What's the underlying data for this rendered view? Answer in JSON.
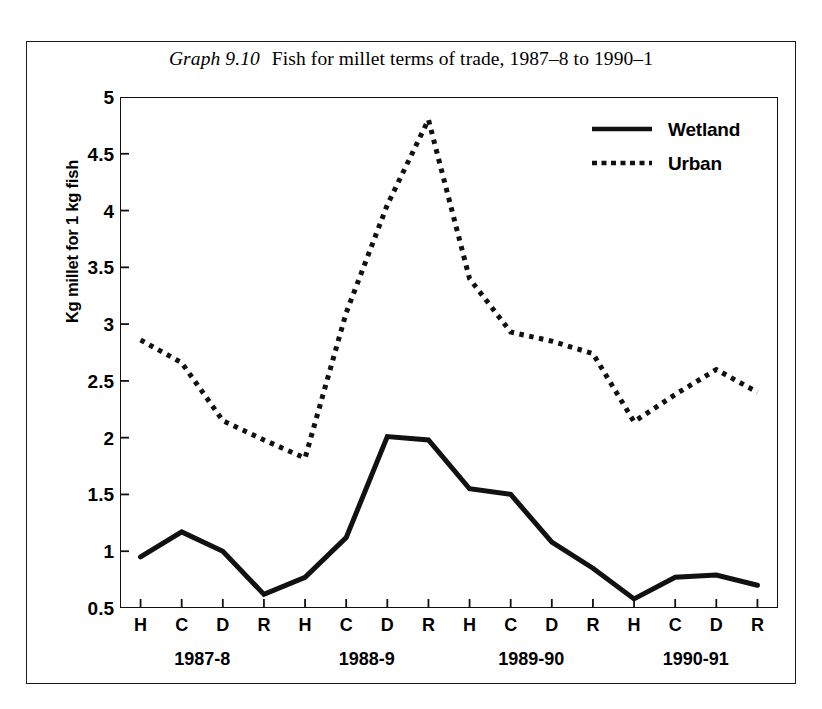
{
  "figure": {
    "title_number": "Graph 9.10",
    "title_text": "Fish for millet terms of trade, 1987–8 to 1990–1"
  },
  "chart_data": {
    "type": "line",
    "title": "Fish for millet terms of trade, 1987–8 to 1990–1",
    "xlabel": "",
    "ylabel": "Kg millet for 1 kg fish",
    "ylim": [
      0.5,
      5
    ],
    "ytick_labels": [
      "0.5",
      "1",
      "1.5",
      "2",
      "2.5",
      "3",
      "3.5",
      "4",
      "4.5",
      "5"
    ],
    "ytick_values": [
      0.5,
      1,
      1.5,
      2,
      2.5,
      3,
      3.5,
      4,
      4.5,
      5
    ],
    "grid": false,
    "legend_position": "top-right",
    "categories": [
      "H",
      "C",
      "D",
      "R",
      "H",
      "C",
      "D",
      "R",
      "H",
      "C",
      "D",
      "R",
      "H",
      "C",
      "D",
      "R"
    ],
    "group_labels": [
      "1987-8",
      "1988-9",
      "1989-90",
      "1990-91"
    ],
    "series": [
      {
        "name": "Wetland",
        "style": "solid",
        "color": "#111111",
        "values": [
          0.95,
          1.17,
          1.0,
          0.62,
          0.77,
          1.12,
          2.01,
          1.98,
          1.55,
          1.5,
          1.08,
          0.85,
          0.58,
          0.77,
          0.79,
          0.7
        ]
      },
      {
        "name": "Urban",
        "style": "dotted",
        "color": "#111111",
        "values": [
          2.86,
          2.66,
          2.15,
          1.98,
          1.82,
          3.1,
          4.05,
          4.8,
          3.4,
          2.93,
          2.85,
          2.74,
          2.14,
          2.38,
          2.6,
          2.4
        ]
      }
    ]
  },
  "legend": {
    "items": [
      {
        "label": "Wetland",
        "style": "solid"
      },
      {
        "label": "Urban",
        "style": "dotted"
      }
    ]
  }
}
